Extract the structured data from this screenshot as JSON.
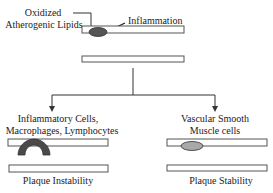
{
  "diagram": {
    "labels": {
      "oxidized_line1": "Oxidized",
      "oxidized_line2": "Atherogenic Lipids",
      "inflammation": "Inflammation",
      "left_branch_line1": "Inflammatory Cells,",
      "left_branch_line2": "Macrophages, Lymphocytes",
      "right_branch_line1": "Vascular Smooth",
      "right_branch_line2": "Muscle cells",
      "left_outcome": "Plaque Instability",
      "right_outcome": "Plaque Stability"
    },
    "colors": {
      "line": "#333333",
      "bar_stroke": "#555555",
      "lipid_fill": "#555555",
      "inflam_cells_fill": "#4a4a4a",
      "vsmc_fill": "#a8a8a8"
    }
  }
}
